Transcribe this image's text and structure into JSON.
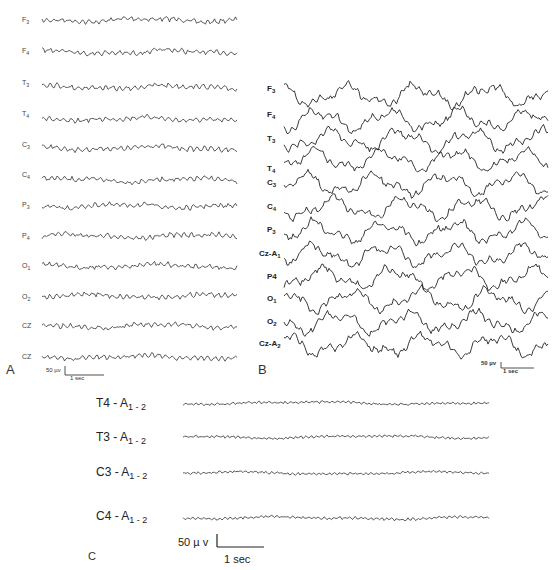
{
  "figure": {
    "panels": [
      {
        "id": "A",
        "letter": "A",
        "channels": [
          {
            "label": "F",
            "sub": "3"
          },
          {
            "label": "F",
            "sub": "4"
          },
          {
            "label": "T",
            "sub": "3"
          },
          {
            "label": "T",
            "sub": "4"
          },
          {
            "label": "C",
            "sub": "3"
          },
          {
            "label": "C",
            "sub": "4"
          },
          {
            "label": "P",
            "sub": "3"
          },
          {
            "label": "P",
            "sub": "4"
          },
          {
            "label": "O",
            "sub": "1"
          },
          {
            "label": "O",
            "sub": "2"
          },
          {
            "label": "CZ",
            "sub": ""
          },
          {
            "label": "CZ",
            "sub": ""
          }
        ],
        "calibration": {
          "amplitude": "50 µv",
          "time": "1 sec"
        }
      },
      {
        "id": "B",
        "letter": "B",
        "channels": [
          {
            "label": "F",
            "sub": "3"
          },
          {
            "label": "F",
            "sub": "4"
          },
          {
            "label": "T",
            "sub": "3"
          },
          {
            "label": "T",
            "sub": "4"
          },
          {
            "label": "C",
            "sub": "3"
          },
          {
            "label": "C",
            "sub": "4"
          },
          {
            "label": "P",
            "sub": "3"
          },
          {
            "label": "Cz-A",
            "sub": "1"
          },
          {
            "label": "P4",
            "sub": ""
          },
          {
            "label": "O",
            "sub": "1"
          },
          {
            "label": "O",
            "sub": "2"
          },
          {
            "label": "Cz-A",
            "sub": "2"
          }
        ],
        "calibration": {
          "amplitude": "50 µv",
          "time": "1 sec"
        }
      },
      {
        "id": "C",
        "letter": "C",
        "channels": [
          {
            "label": "T4 - A",
            "sub": "1 - 2"
          },
          {
            "label": "T3 - A",
            "sub": "1 - 2"
          },
          {
            "label": "C3 - A",
            "sub": "1 - 2"
          },
          {
            "label": "C4 - A",
            "sub": "1 - 2"
          }
        ],
        "calibration": {
          "amplitude": "50 µ v",
          "time": "1 sec"
        }
      }
    ]
  }
}
